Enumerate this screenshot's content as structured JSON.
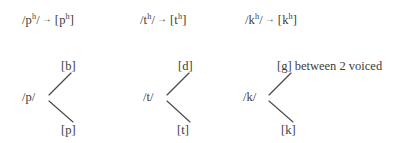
{
  "diagram": {
    "ink_color": "#3c3c3c",
    "line_color": "#4a4a4a",
    "background": "#ffffff",
    "arrow_glyph": "→"
  },
  "rules": [
    {
      "id": "rule-p",
      "input_open": "/",
      "input_base": "p",
      "input_sup": "h",
      "input_close": "/",
      "arrow": "→",
      "output_open": "[",
      "output_base": "p",
      "output_sup": "h",
      "output_close": "]",
      "text": "/pʰ/ → [pʰ]"
    },
    {
      "id": "rule-t",
      "input_open": "/",
      "input_base": "t",
      "input_sup": "h",
      "input_close": "/",
      "arrow": "→",
      "output_open": "[",
      "output_base": "t",
      "output_sup": "h",
      "output_close": "]",
      "text": "/tʰ/ → [tʰ]"
    },
    {
      "id": "rule-k",
      "input_open": "/",
      "input_base": "k",
      "input_sup": "h",
      "input_close": "/",
      "arrow": "→",
      "output_open": "[",
      "output_base": "k",
      "output_sup": "h",
      "output_close": "]",
      "text": "/kʰ/ → [kʰ]"
    }
  ],
  "trees": [
    {
      "id": "tree-p",
      "root": "/p/",
      "upper_leaf": "[b]",
      "upper_note": "",
      "lower_leaf": "[p]"
    },
    {
      "id": "tree-t",
      "root": "/t/",
      "upper_leaf": "[d]",
      "upper_note": "",
      "lower_leaf": "[t]"
    },
    {
      "id": "tree-k",
      "root": "/k/",
      "upper_leaf": "[g]",
      "upper_note": "between 2 voiced",
      "lower_leaf": "[k]"
    }
  ]
}
